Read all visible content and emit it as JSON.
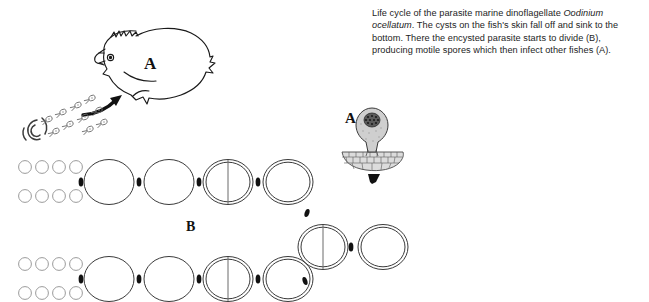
{
  "figure": {
    "caption_parts": {
      "lead": "Life cycle of the parasite marine dinoflagellate ",
      "species": "Oodinium ocellatum",
      "rest": ". The cysts on the fish's skin fall off and sink to the bottom. There the encysted parasite starts to divide (B), producing motile spores which then infect other fishes (A)."
    },
    "labels": {
      "fish_a": "A",
      "trophont_a": "A",
      "division_b": "B"
    },
    "colors": {
      "ink": "#1a1a1a",
      "cyst_outline": "#3a3a3a",
      "spore_outline": "#8a8a8a",
      "arrow_fill": "#111111",
      "tissue_fill": "#d8d8d8",
      "nucleus_fill": "#3c3c3c",
      "background": "#ffffff"
    },
    "icons": {
      "fish": "fish-icon",
      "trophont": "trophont-icon",
      "host_tissue": "host-tissue-icon",
      "spore_swarm": "spore-swarm-icon",
      "swirl": "water-swirl-icon",
      "curved_arrow": "curved-arrow-icon",
      "down_arrow": "down-arrow-icon",
      "chain_arrow": "chain-arrow-icon"
    },
    "stages": {
      "spore_rows": [
        {
          "name": "spore-row-upper-top",
          "count": 4
        },
        {
          "name": "spore-row-upper-bottom",
          "count": 4
        },
        {
          "name": "spore-row-lower-top",
          "count": 4
        },
        {
          "name": "spore-row-lower-bottom",
          "count": 4
        }
      ],
      "upper_chain": [
        {
          "name": "cyst-plain-1",
          "wall": "single",
          "divided": false
        },
        {
          "name": "cyst-plain-2",
          "wall": "single",
          "divided": false
        },
        {
          "name": "cyst-divided-3",
          "wall": "double",
          "divided": true
        },
        {
          "name": "cyst-encysted-4",
          "wall": "double",
          "divided": false
        }
      ],
      "middle_chain": [
        {
          "name": "cyst-divided-mid-1",
          "wall": "double",
          "divided": true
        },
        {
          "name": "cyst-encysted-mid-2",
          "wall": "double",
          "divided": false
        }
      ],
      "lower_chain": [
        {
          "name": "cyst-plain-lower-1",
          "wall": "single",
          "divided": false
        },
        {
          "name": "cyst-plain-lower-2",
          "wall": "single",
          "divided": false
        },
        {
          "name": "cyst-divided-lower-3",
          "wall": "double",
          "divided": true
        },
        {
          "name": "cyst-encysted-lower-4",
          "wall": "double",
          "divided": false
        }
      ]
    }
  }
}
